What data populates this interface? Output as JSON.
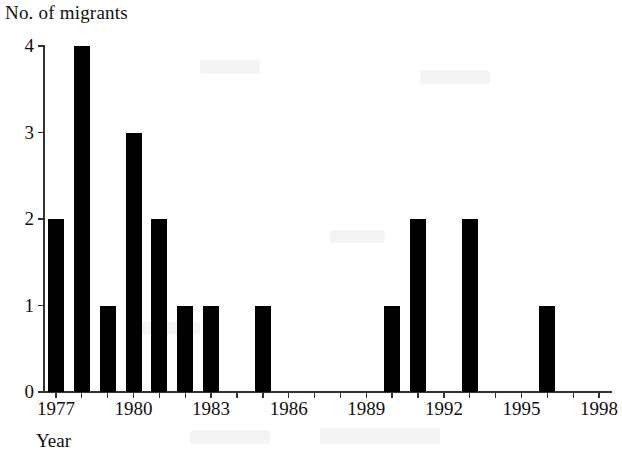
{
  "chart_data": {
    "type": "bar",
    "title": "",
    "ylabel": "No. of migrants",
    "xlabel": "Year",
    "grid": false,
    "legend": false,
    "ylim": [
      0,
      4
    ],
    "xlim": [
      1976.5,
      1998.5
    ],
    "ytick_labels": [
      "0",
      "1",
      "2",
      "3",
      "4"
    ],
    "ytick_values": [
      0,
      1,
      2,
      3,
      4
    ],
    "xtick_labels": [
      "1977",
      "1980",
      "1983",
      "1986",
      "1989",
      "1992",
      "1995",
      "1998"
    ],
    "xtick_values": [
      1977,
      1980,
      1983,
      1986,
      1989,
      1992,
      1995,
      1998
    ],
    "categories": [
      "1977",
      "1978",
      "1979",
      "1980",
      "1981",
      "1982",
      "1983",
      "1984",
      "1985",
      "1986",
      "1987",
      "1988",
      "1989",
      "1990",
      "1991",
      "1992",
      "1993",
      "1994",
      "1995",
      "1996",
      "1997",
      "1998"
    ],
    "values": [
      2,
      4,
      1,
      3,
      2,
      1,
      1,
      0,
      1,
      0,
      0,
      0,
      0,
      1,
      2,
      0,
      2,
      0,
      0,
      1,
      0,
      0
    ],
    "bar_color": "#000000"
  }
}
